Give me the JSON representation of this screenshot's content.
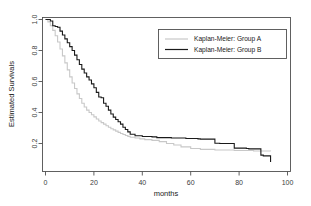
{
  "chart_data": {
    "type": "line",
    "title": "",
    "xlabel": "months",
    "ylabel": "Estimated Survivals",
    "xlim": [
      0,
      100
    ],
    "ylim": [
      0.0,
      1.0
    ],
    "xticks": [
      0,
      20,
      40,
      60,
      80,
      100
    ],
    "xticklabels": [
      "0",
      "20",
      "40",
      "60",
      "80",
      "100"
    ],
    "yticks": [
      0.2,
      0.4,
      0.6,
      0.8,
      1.0
    ],
    "yticklabels": [
      "0.2",
      "0.4",
      "0.6",
      "0.8",
      "1.0"
    ],
    "grid": false,
    "legend_position": "upper right",
    "step_type": "post",
    "series": [
      {
        "name": "Kaplan-Meier: Group A",
        "color": "#c8c8c8",
        "linewidth": 1.1,
        "x": [
          0,
          1,
          2,
          3,
          4,
          5,
          6,
          7,
          8,
          9,
          10,
          11,
          12,
          13,
          14,
          15,
          16,
          17,
          18,
          19,
          20,
          21,
          22,
          23,
          24,
          25,
          26,
          27,
          28,
          29,
          30,
          31,
          32,
          33,
          34,
          35,
          37,
          39,
          41,
          44,
          47,
          50,
          53,
          56,
          60,
          64,
          70,
          78,
          86,
          93
        ],
        "y": [
          1.0,
          0.985,
          0.96,
          0.93,
          0.895,
          0.855,
          0.81,
          0.765,
          0.72,
          0.675,
          0.63,
          0.59,
          0.555,
          0.52,
          0.49,
          0.46,
          0.435,
          0.415,
          0.4,
          0.385,
          0.372,
          0.358,
          0.345,
          0.335,
          0.325,
          0.315,
          0.305,
          0.295,
          0.288,
          0.28,
          0.272,
          0.265,
          0.258,
          0.252,
          0.246,
          0.24,
          0.235,
          0.23,
          0.225,
          0.22,
          0.212,
          0.2,
          0.19,
          0.178,
          0.168,
          0.162,
          0.158,
          0.155,
          0.152,
          0.15
        ]
      },
      {
        "name": "Kaplan-Meier: Group B",
        "color": "#1a1a1a",
        "linewidth": 1.1,
        "x": [
          0,
          2,
          3,
          4,
          5,
          6,
          7,
          8,
          9,
          10,
          11,
          12,
          13,
          14,
          15,
          16,
          17,
          18,
          19,
          20,
          21,
          22,
          23,
          24,
          25,
          26,
          27,
          28,
          29,
          30,
          31,
          32,
          33,
          34,
          35,
          37,
          40,
          44,
          46,
          52,
          58,
          63,
          64,
          70,
          72,
          78,
          83,
          84,
          89,
          90,
          93
        ],
        "y": [
          1.0,
          0.99,
          0.96,
          0.955,
          0.95,
          0.925,
          0.9,
          0.875,
          0.85,
          0.825,
          0.8,
          0.77,
          0.74,
          0.71,
          0.68,
          0.655,
          0.63,
          0.61,
          0.585,
          0.56,
          0.53,
          0.5,
          0.495,
          0.46,
          0.44,
          0.415,
          0.39,
          0.37,
          0.355,
          0.34,
          0.325,
          0.305,
          0.29,
          0.275,
          0.26,
          0.25,
          0.245,
          0.243,
          0.238,
          0.235,
          0.232,
          0.23,
          0.228,
          0.202,
          0.2,
          0.17,
          0.168,
          0.165,
          0.125,
          0.12,
          0.08
        ]
      }
    ]
  },
  "legend": {
    "entries": [
      {
        "label": "Kaplan-Meier: Group A",
        "color": "#c8c8c8"
      },
      {
        "label": "Kaplan-Meier: Group B",
        "color": "#1a1a1a"
      }
    ]
  },
  "axes": {
    "x_title": "months",
    "y_title": "Estimated Survivals"
  },
  "colors": {
    "background": "#ffffff",
    "frame": "#505050",
    "text": "#1a1a1a",
    "tick_text": "#3c3c3c",
    "group_a": "#c8c8c8",
    "group_b": "#1a1a1a"
  }
}
